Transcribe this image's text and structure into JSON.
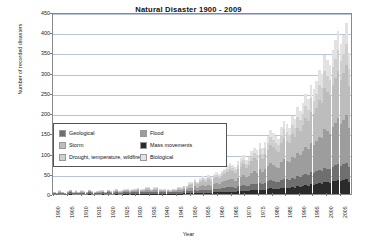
{
  "chart_data": {
    "type": "bar",
    "title": "Natural Disaster 1900 - 2009",
    "xlabel": "Year",
    "ylabel": "Number of recorded disasters",
    "ylim": [
      0,
      450
    ],
    "ytick_labels": [
      "450",
      "400",
      "350",
      "300",
      "250",
      "200",
      "150",
      "100",
      "50",
      "0"
    ],
    "ytick_values": [
      450,
      400,
      350,
      300,
      250,
      200,
      150,
      100,
      50,
      0
    ],
    "grid": true,
    "stacked": true,
    "legend_position": "inside-left-middle",
    "xtick_labels": [
      "1900",
      "1905",
      "1910",
      "1915",
      "1920",
      "1925",
      "1930",
      "1935",
      "1940",
      "1945",
      "1950",
      "1955",
      "1960",
      "1965",
      "1970",
      "1975",
      "1980",
      "1985",
      "1990",
      "1995",
      "2000",
      "2005"
    ],
    "xtick_step": 5,
    "x": [
      1900,
      1901,
      1902,
      1903,
      1904,
      1905,
      1906,
      1907,
      1908,
      1909,
      1910,
      1911,
      1912,
      1913,
      1914,
      1915,
      1916,
      1917,
      1918,
      1919,
      1920,
      1921,
      1922,
      1923,
      1924,
      1925,
      1926,
      1927,
      1928,
      1929,
      1930,
      1931,
      1932,
      1933,
      1934,
      1935,
      1936,
      1937,
      1938,
      1939,
      1940,
      1941,
      1942,
      1943,
      1944,
      1945,
      1946,
      1947,
      1948,
      1949,
      1950,
      1951,
      1952,
      1953,
      1954,
      1955,
      1956,
      1957,
      1958,
      1959,
      1960,
      1961,
      1962,
      1963,
      1964,
      1965,
      1966,
      1967,
      1968,
      1969,
      1970,
      1971,
      1972,
      1973,
      1974,
      1975,
      1976,
      1977,
      1978,
      1979,
      1980,
      1981,
      1982,
      1983,
      1984,
      1985,
      1986,
      1987,
      1988,
      1989,
      1990,
      1991,
      1992,
      1993,
      1994,
      1995,
      1996,
      1997,
      1998,
      1999,
      2000,
      2001,
      2002,
      2003,
      2004,
      2005,
      2006,
      2007,
      2008,
      2009
    ],
    "series": [
      {
        "name": "Geological",
        "color": "#6f6f6f",
        "values": [
          2,
          1,
          3,
          2,
          1,
          2,
          4,
          2,
          3,
          2,
          3,
          2,
          2,
          4,
          2,
          2,
          2,
          3,
          3,
          2,
          4,
          2,
          3,
          4,
          2,
          3,
          3,
          4,
          3,
          3,
          4,
          5,
          3,
          4,
          5,
          5,
          3,
          4,
          5,
          4,
          3,
          4,
          3,
          3,
          4,
          3,
          5,
          4,
          5,
          5,
          6,
          6,
          7,
          6,
          7,
          8,
          7,
          8,
          7,
          8,
          9,
          8,
          9,
          10,
          11,
          12,
          11,
          10,
          12,
          13,
          14,
          12,
          13,
          15,
          16,
          15,
          17,
          14,
          16,
          18,
          20,
          19,
          18,
          17,
          20,
          22,
          21,
          20,
          23,
          22,
          25,
          24,
          26,
          28,
          27,
          30,
          29,
          31,
          33,
          32,
          35,
          34,
          33,
          36,
          38,
          40,
          37,
          39,
          41,
          36
        ]
      },
      {
        "name": "Flood",
        "color": "#9d9d9d",
        "values": [
          1,
          1,
          2,
          1,
          1,
          2,
          2,
          1,
          2,
          1,
          2,
          2,
          1,
          2,
          2,
          1,
          2,
          2,
          2,
          1,
          3,
          2,
          2,
          3,
          2,
          2,
          3,
          3,
          2,
          3,
          3,
          4,
          3,
          3,
          4,
          4,
          3,
          4,
          4,
          3,
          3,
          3,
          3,
          2,
          3,
          3,
          4,
          4,
          5,
          5,
          7,
          8,
          9,
          8,
          10,
          11,
          10,
          12,
          11,
          13,
          14,
          13,
          15,
          16,
          18,
          20,
          19,
          18,
          21,
          23,
          25,
          22,
          24,
          28,
          30,
          29,
          33,
          30,
          34,
          38,
          42,
          40,
          38,
          36,
          44,
          48,
          46,
          44,
          52,
          50,
          58,
          55,
          60,
          66,
          63,
          72,
          70,
          75,
          82,
          80,
          95,
          92,
          88,
          98,
          105,
          112,
          104,
          110,
          118,
          98
        ]
      },
      {
        "name": "Storm",
        "color": "#bdbdbd",
        "values": [
          1,
          1,
          2,
          1,
          1,
          2,
          2,
          1,
          2,
          1,
          2,
          2,
          1,
          2,
          2,
          1,
          2,
          2,
          2,
          1,
          2,
          2,
          2,
          3,
          2,
          2,
          3,
          3,
          2,
          3,
          3,
          3,
          3,
          3,
          4,
          4,
          3,
          4,
          4,
          3,
          3,
          3,
          3,
          2,
          3,
          3,
          4,
          4,
          5,
          5,
          8,
          9,
          10,
          9,
          11,
          12,
          11,
          13,
          12,
          14,
          15,
          14,
          16,
          18,
          20,
          22,
          21,
          20,
          23,
          25,
          27,
          24,
          26,
          30,
          33,
          32,
          36,
          33,
          37,
          41,
          46,
          44,
          42,
          40,
          48,
          52,
          50,
          48,
          56,
          54,
          62,
          60,
          65,
          72,
          69,
          78,
          76,
          82,
          90,
          88,
          102,
          98,
          95,
          105,
          112,
          118,
          110,
          116,
          124,
          104
        ]
      },
      {
        "name": "Mass movements",
        "color": "#2b2b2b",
        "values": [
          0,
          0,
          0,
          0,
          0,
          0,
          1,
          0,
          0,
          0,
          0,
          0,
          0,
          1,
          0,
          0,
          0,
          0,
          1,
          0,
          0,
          0,
          0,
          1,
          0,
          0,
          1,
          1,
          0,
          1,
          1,
          1,
          1,
          1,
          1,
          1,
          1,
          1,
          1,
          1,
          1,
          1,
          1,
          1,
          1,
          1,
          1,
          1,
          2,
          2,
          2,
          2,
          3,
          2,
          3,
          3,
          3,
          3,
          3,
          4,
          4,
          4,
          5,
          5,
          6,
          6,
          6,
          5,
          7,
          7,
          8,
          7,
          8,
          9,
          10,
          9,
          11,
          10,
          11,
          13,
          14,
          13,
          12,
          12,
          15,
          16,
          15,
          14,
          17,
          16,
          19,
          18,
          20,
          22,
          21,
          24,
          23,
          25,
          27,
          26,
          30,
          29,
          28,
          31,
          33,
          35,
          32,
          34,
          36,
          30
        ]
      },
      {
        "name": "Drought, temperature, wildfire",
        "color": "#cfcfcf",
        "values": [
          0,
          0,
          1,
          0,
          0,
          1,
          1,
          0,
          1,
          0,
          1,
          1,
          0,
          1,
          1,
          0,
          1,
          1,
          1,
          0,
          1,
          1,
          1,
          1,
          1,
          1,
          1,
          1,
          1,
          1,
          1,
          2,
          1,
          1,
          2,
          2,
          1,
          2,
          2,
          1,
          1,
          1,
          1,
          1,
          1,
          1,
          2,
          2,
          2,
          2,
          3,
          3,
          4,
          3,
          4,
          5,
          4,
          5,
          4,
          5,
          6,
          5,
          6,
          7,
          8,
          9,
          8,
          7,
          9,
          10,
          11,
          9,
          10,
          12,
          13,
          12,
          14,
          13,
          15,
          17,
          19,
          18,
          17,
          16,
          20,
          22,
          21,
          19,
          23,
          22,
          26,
          25,
          27,
          30,
          28,
          33,
          31,
          34,
          38,
          36,
          42,
          40,
          38,
          44,
          47,
          50,
          45,
          48,
          52,
          42
        ]
      },
      {
        "name": "Biological",
        "color": "#e2e2e2",
        "values": [
          0,
          0,
          1,
          0,
          0,
          1,
          1,
          0,
          1,
          0,
          1,
          1,
          0,
          1,
          1,
          0,
          1,
          1,
          1,
          0,
          1,
          1,
          1,
          1,
          1,
          1,
          1,
          1,
          1,
          1,
          1,
          1,
          1,
          1,
          2,
          2,
          1,
          2,
          2,
          1,
          1,
          1,
          1,
          1,
          1,
          1,
          2,
          2,
          2,
          2,
          3,
          3,
          4,
          3,
          4,
          5,
          4,
          5,
          4,
          5,
          6,
          5,
          6,
          7,
          8,
          9,
          8,
          7,
          9,
          10,
          11,
          9,
          10,
          12,
          13,
          12,
          14,
          13,
          15,
          16,
          18,
          17,
          16,
          15,
          19,
          21,
          20,
          18,
          22,
          21,
          25,
          24,
          26,
          29,
          27,
          32,
          30,
          33,
          37,
          35,
          41,
          39,
          37,
          43,
          46,
          49,
          44,
          47,
          51,
          40
        ]
      }
    ]
  },
  "legend": {
    "items": [
      {
        "label": "Geological",
        "color": "#6f6f6f"
      },
      {
        "label": "Flood",
        "color": "#9d9d9d"
      },
      {
        "label": "Storm",
        "color": "#bdbdbd"
      },
      {
        "label": "Mass movements",
        "color": "#2b2b2b"
      },
      {
        "label": "Drought, temperature, wildfire",
        "color": "#cfcfcf"
      },
      {
        "label": "Biological",
        "color": "#e2e2e2"
      }
    ]
  }
}
